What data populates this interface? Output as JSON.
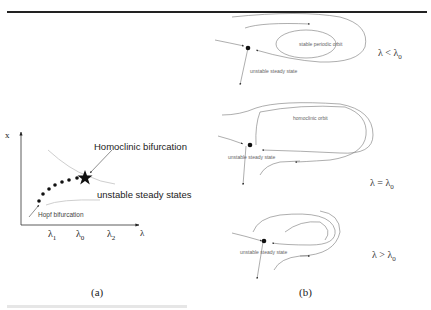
{
  "panel_a": {
    "caption": "(a)",
    "axis_y_label": "x",
    "axis_x_label": "λ",
    "x_ticks": [
      {
        "base": "λ",
        "sub": "1"
      },
      {
        "base": "λ",
        "sub": "0"
      },
      {
        "base": "λ",
        "sub": "2"
      }
    ],
    "annotations": {
      "homoclinic": "Homoclinic bifurcation",
      "unstable": "unstable steady states",
      "hopf": "Hopf bifurcation"
    }
  },
  "panel_b": {
    "caption": "(b)",
    "rows": [
      {
        "orbit_label": "stable periodic orbit",
        "steady_label": "unstable steady state",
        "condition": {
          "lhs": "λ",
          "op": "<",
          "rhs": "λ",
          "sub": "0"
        }
      },
      {
        "orbit_label": "homoclinic orbit",
        "steady_label": "unstable steady state",
        "condition": {
          "lhs": "λ",
          "op": "=",
          "rhs": "λ",
          "sub": "0"
        }
      },
      {
        "steady_label": "unstable steady state",
        "condition": {
          "lhs": "λ",
          "op": ">",
          "rhs": "λ",
          "sub": "0"
        }
      }
    ]
  }
}
